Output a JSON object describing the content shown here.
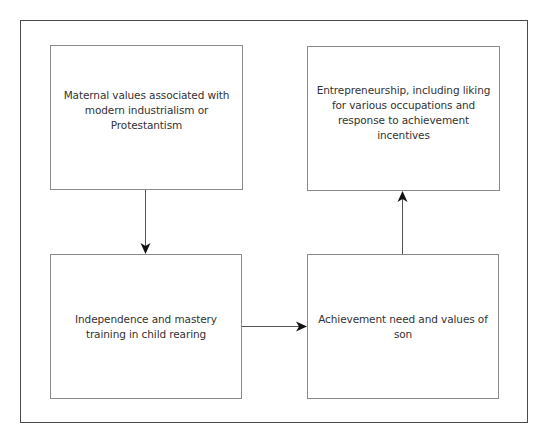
{
  "diagram": {
    "type": "flowchart",
    "nodes": [
      {
        "id": "maternal",
        "label": "Maternal values associated with modern industrialism or Protestantism"
      },
      {
        "id": "independence",
        "label": "Independence and mastery training in child rearing"
      },
      {
        "id": "achievement",
        "label": "Achievement need and values of son"
      },
      {
        "id": "entrepreneurship",
        "label": "Entrepreneurship, including liking for various occupations and response to achievement incentives"
      }
    ],
    "edges": [
      {
        "from": "maternal",
        "to": "independence",
        "direction": "down"
      },
      {
        "from": "independence",
        "to": "achievement",
        "direction": "right"
      },
      {
        "from": "achievement",
        "to": "entrepreneurship",
        "direction": "up"
      }
    ],
    "colors": {
      "frame": "#4a4a4a",
      "box_border": "#8a8a8a",
      "arrow": "#555555",
      "arrowhead": "#111111",
      "text": "#333333"
    }
  }
}
